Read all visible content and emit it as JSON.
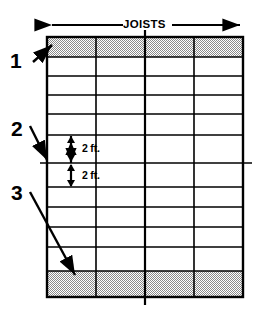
{
  "diagram": {
    "title_label": "JOISTS",
    "callouts": [
      {
        "id": "callout-1",
        "text": "1",
        "x": 10,
        "y": 50,
        "target": "top-shaded-band"
      },
      {
        "id": "callout-2",
        "text": "2",
        "x": 11,
        "y": 118,
        "target": "mid-grid-line"
      },
      {
        "id": "callout-3",
        "text": "3",
        "x": 11,
        "y": 182,
        "target": "bottom-shaded-band"
      }
    ],
    "dimensions": [
      {
        "id": "dim-upper",
        "text": "2 ft.",
        "x": 82,
        "y": 140
      },
      {
        "id": "dim-lower",
        "text": "2 ft.",
        "x": 82,
        "y": 168
      }
    ],
    "grid": {
      "left": 47,
      "right": 243,
      "top": 37,
      "bottom": 297,
      "columns": 4,
      "column_lines": [
        96,
        145,
        194
      ],
      "rows": 11,
      "row_lines": [
        57,
        76,
        95,
        114,
        135,
        163,
        187,
        207,
        227,
        247,
        271
      ],
      "shaded_bands": [
        {
          "name": "top-band",
          "y": 37,
          "height": 20
        },
        {
          "name": "bottom-band",
          "y": 271,
          "height": 26
        }
      ]
    },
    "colors": {
      "line": "#000000",
      "shade": "#b8b8b8",
      "background": "#ffffff"
    }
  }
}
